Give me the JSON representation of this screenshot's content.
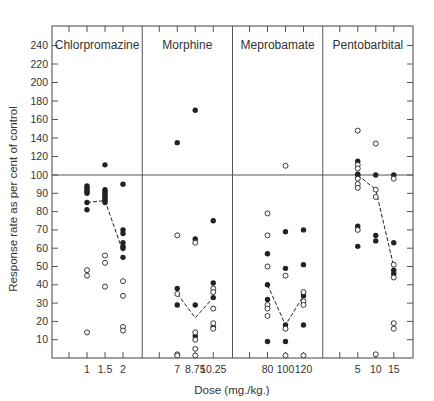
{
  "chart_data": {
    "type": "scatter",
    "title": "",
    "xlabel": "Dose (mg./kg.)",
    "ylabel": "Response rate as per cent of control",
    "y_ticks": [
      10,
      20,
      30,
      40,
      50,
      60,
      70,
      80,
      90,
      100,
      120,
      140,
      160,
      180,
      200,
      220,
      240
    ],
    "y_axis_note": "Broken scale: 0–100 in steps of 10, 100–240 in steps of 20 (compressed)",
    "reference_line": 100,
    "grid": false,
    "legend": "none (filled circles and open circles denote two groups of subjects; dashed line connects medians)",
    "marker_series": [
      "filled",
      "open"
    ],
    "panels": [
      {
        "drug": "Chlorpromazine",
        "doses": [
          "1",
          "1.5",
          "2"
        ],
        "filled": [
          [
            94,
            93,
            92,
            91,
            90,
            85,
            81
          ],
          [
            111,
            92,
            91,
            90,
            89,
            88,
            87,
            86,
            85
          ],
          [
            95,
            70,
            68,
            63,
            61,
            60,
            55
          ]
        ],
        "open": [
          [
            48,
            45,
            14
          ],
          [
            56,
            52,
            39
          ],
          [
            42,
            34,
            17,
            15
          ]
        ],
        "median_line": [
          85,
          86,
          58
        ]
      },
      {
        "drug": "Morphine",
        "doses": [
          "7",
          "8.75",
          "10.25"
        ],
        "filled": [
          [
            135,
            38,
            29
          ],
          [
            170,
            65,
            29,
            12
          ],
          [
            75,
            41,
            33,
            17
          ]
        ],
        "open": [
          [
            67,
            35,
            2,
            0
          ],
          [
            63,
            14,
            10,
            5,
            0
          ],
          [
            38,
            36,
            27,
            19,
            16
          ]
        ],
        "median_line": [
          35,
          22,
          33
        ]
      },
      {
        "drug": "Meprobamate",
        "doses": [
          "80",
          "100",
          "120"
        ],
        "filled": [
          [
            57,
            40,
            32,
            9
          ],
          [
            69,
            49,
            18,
            9
          ],
          [
            70,
            51,
            34,
            18
          ]
        ],
        "open": [
          [
            79,
            67,
            50,
            29,
            27,
            23
          ],
          [
            110,
            45,
            16,
            0
          ],
          [
            36,
            31,
            29,
            0
          ]
        ],
        "median_line": [
          40,
          18,
          34
        ]
      },
      {
        "drug": "Pentobarbital",
        "doses": [
          "5",
          "10",
          "15"
        ],
        "filled": [
          [
            115,
            101,
            100,
            72,
            61
          ],
          [
            100,
            67,
            64
          ],
          [
            100,
            63,
            48,
            46
          ]
        ],
        "open": [
          [
            148,
            111,
            107,
            98,
            95,
            93,
            70
          ],
          [
            134,
            92,
            88,
            2
          ],
          [
            98,
            51,
            44,
            19,
            16
          ]
        ],
        "median_line": [
          100,
          92,
          50
        ]
      }
    ]
  },
  "colors": {
    "ink": "#222222",
    "axis": "#555555",
    "background": "#ffffff"
  }
}
